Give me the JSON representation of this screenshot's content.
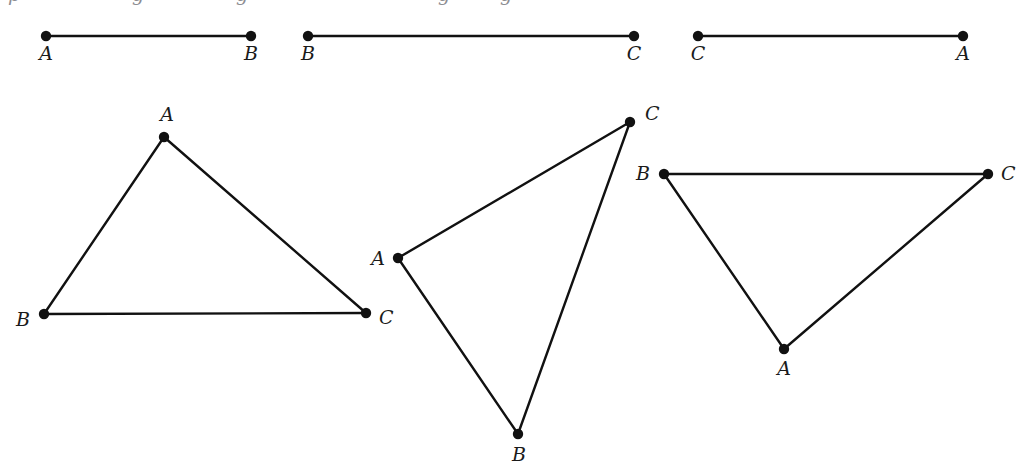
{
  "figure": {
    "width": 1031,
    "height": 476,
    "background_color": "#ffffff",
    "ink_color": "#111111",
    "label_color": "#1a1a1a",
    "stroke_width": 2.4,
    "dot_radius": 5.2,
    "cropped_text_top": {
      "visible": "partial descenders of a cropped line of text above the figure",
      "fragments": [
        {
          "text": "p",
          "x": 8
        },
        {
          "text": "g",
          "x": 132
        },
        {
          "text": "g",
          "x": 236
        },
        {
          "text": "g",
          "x": 438
        },
        {
          "text": "g",
          "x": 500
        }
      ]
    },
    "segments": [
      {
        "name": "segment-ab",
        "endpoints": [
          {
            "label": "A",
            "x": 46,
            "y": 36,
            "label_x": 46,
            "label_y": 60,
            "anchor": "middle"
          },
          {
            "label": "B",
            "x": 251,
            "y": 36,
            "label_x": 251,
            "label_y": 60,
            "anchor": "middle"
          }
        ]
      },
      {
        "name": "segment-bc",
        "endpoints": [
          {
            "label": "B",
            "x": 308,
            "y": 36,
            "label_x": 308,
            "label_y": 60,
            "anchor": "middle"
          },
          {
            "label": "C",
            "x": 634,
            "y": 36,
            "label_x": 634,
            "label_y": 60,
            "anchor": "middle"
          }
        ]
      },
      {
        "name": "segment-ca",
        "endpoints": [
          {
            "label": "C",
            "x": 698,
            "y": 36,
            "label_x": 698,
            "label_y": 60,
            "anchor": "middle"
          },
          {
            "label": "A",
            "x": 963,
            "y": 36,
            "label_x": 963,
            "label_y": 60,
            "anchor": "middle"
          }
        ]
      }
    ],
    "triangles": [
      {
        "name": "triangle-left",
        "vertices": [
          {
            "label": "A",
            "x": 164,
            "y": 137,
            "label_x": 167,
            "label_y": 121,
            "anchor": "middle"
          },
          {
            "label": "B",
            "x": 44,
            "y": 314,
            "label_x": 30,
            "label_y": 326,
            "anchor": "end"
          },
          {
            "label": "C",
            "x": 366,
            "y": 313,
            "label_x": 379,
            "label_y": 324,
            "anchor": "start"
          }
        ]
      },
      {
        "name": "triangle-middle",
        "vertices": [
          {
            "label": "A",
            "x": 398,
            "y": 258,
            "label_x": 385,
            "label_y": 265,
            "anchor": "end"
          },
          {
            "label": "B",
            "x": 518,
            "y": 434,
            "label_x": 519,
            "label_y": 461,
            "anchor": "middle"
          },
          {
            "label": "C",
            "x": 630,
            "y": 122,
            "label_x": 645,
            "label_y": 120,
            "anchor": "start"
          }
        ]
      },
      {
        "name": "triangle-right",
        "vertices": [
          {
            "label": "A",
            "x": 784,
            "y": 349,
            "label_x": 784,
            "label_y": 375,
            "anchor": "middle"
          },
          {
            "label": "B",
            "x": 664,
            "y": 174,
            "label_x": 650,
            "label_y": 180,
            "anchor": "end"
          },
          {
            "label": "C",
            "x": 988,
            "y": 174,
            "label_x": 1001,
            "label_y": 180,
            "anchor": "start"
          }
        ]
      }
    ]
  }
}
